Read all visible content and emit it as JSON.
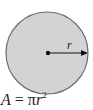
{
  "diagram": {
    "shape": "circle",
    "fill_color": "#d3d3d3",
    "stroke_color": "#6e6e6e",
    "radius_label": "r",
    "formula": {
      "lhs": "A",
      "equals": "=",
      "pi": "π",
      "var": "r",
      "exponent": "2"
    }
  }
}
